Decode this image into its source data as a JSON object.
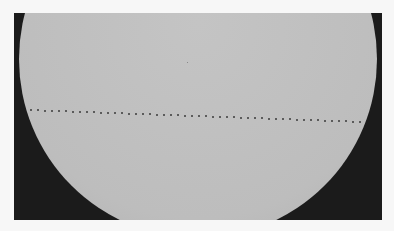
{
  "image": {
    "subject": "Solar disk with transit track",
    "colors": {
      "page_background": "#f7f7f7",
      "sky_background": "#1b1b1b",
      "solar_disk": "#bdbdbd",
      "transit_dot": "#3a3a3a"
    },
    "frame": {
      "x": 14,
      "y": 13,
      "width": 368,
      "height": 207
    },
    "disk": {
      "cx": 198,
      "cy": 59,
      "r": 179
    },
    "transit_track": {
      "start": {
        "x": 31,
        "y": 110
      },
      "end": {
        "x": 360,
        "y": 122
      },
      "dot_count": 48
    },
    "small_spot": {
      "x": 187,
      "y": 62
    }
  }
}
